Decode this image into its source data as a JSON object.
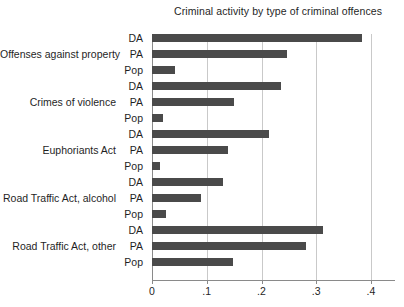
{
  "chart_data": {
    "type": "bar",
    "orientation": "horizontal",
    "title": "Criminal activity by type of criminal offences",
    "xlabel": "",
    "ylabel": "",
    "xlim": [
      0,
      0.4
    ],
    "xticks": [
      0,
      0.1,
      0.2,
      0.3,
      0.4
    ],
    "xtick_labels": [
      "0",
      ".1",
      ".2",
      ".3",
      ".4"
    ],
    "grid": true,
    "legend": "none",
    "bar_color": "#4a4a4a",
    "series_names": [
      "DA",
      "PA",
      "Pop"
    ],
    "categories": [
      "Offenses against property",
      "Crimes of violence",
      "Euphoriants Act",
      "Road Traffic Act, alcohol",
      "Road Traffic Act, other"
    ],
    "series": [
      {
        "name": "DA",
        "values": [
          0.383,
          0.236,
          0.214,
          0.13,
          0.312
        ]
      },
      {
        "name": "PA",
        "values": [
          0.247,
          0.15,
          0.139,
          0.089,
          0.281
        ]
      },
      {
        "name": "Pop",
        "values": [
          0.042,
          0.02,
          0.015,
          0.025,
          0.148
        ]
      }
    ],
    "groups": [
      {
        "label": "Offenses against property",
        "bars": [
          {
            "series": "DA",
            "value": 0.383
          },
          {
            "series": "PA",
            "value": 0.247
          },
          {
            "series": "Pop",
            "value": 0.042
          }
        ]
      },
      {
        "label": "Crimes of violence",
        "bars": [
          {
            "series": "DA",
            "value": 0.236
          },
          {
            "series": "PA",
            "value": 0.15
          },
          {
            "series": "Pop",
            "value": 0.02
          }
        ]
      },
      {
        "label": "Euphoriants Act",
        "bars": [
          {
            "series": "DA",
            "value": 0.214
          },
          {
            "series": "PA",
            "value": 0.139
          },
          {
            "series": "Pop",
            "value": 0.015
          }
        ]
      },
      {
        "label": "Road Traffic Act, alcohol",
        "bars": [
          {
            "series": "DA",
            "value": 0.13
          },
          {
            "series": "PA",
            "value": 0.089
          },
          {
            "series": "Pop",
            "value": 0.025
          }
        ]
      },
      {
        "label": "Road Traffic Act, other",
        "bars": [
          {
            "series": "DA",
            "value": 0.312
          },
          {
            "series": "PA",
            "value": 0.281
          },
          {
            "series": "Pop",
            "value": 0.148
          }
        ]
      }
    ]
  }
}
